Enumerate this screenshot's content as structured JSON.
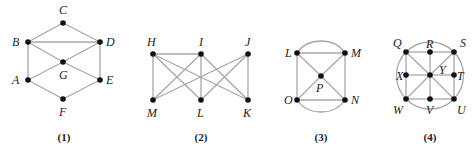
{
  "style": {
    "edge_color": "#a8a8a8",
    "node_color": "#111111",
    "label_color": "#222222",
    "background": "#ffffff"
  },
  "graphs": [
    {
      "caption": "(1)",
      "caption_pos": [
        64,
        141
      ],
      "nodes": [
        {
          "id": "C",
          "x": 63,
          "y": 23,
          "lx": 59,
          "ly": 14
        },
        {
          "id": "B",
          "x": 28,
          "y": 42,
          "lx": 12,
          "ly": 46
        },
        {
          "id": "D",
          "x": 100,
          "y": 42,
          "lx": 106,
          "ly": 46
        },
        {
          "id": "G",
          "x": 63,
          "y": 62,
          "lx": 59,
          "ly": 79
        },
        {
          "id": "A",
          "x": 28,
          "y": 80,
          "lx": 12,
          "ly": 84
        },
        {
          "id": "E",
          "x": 100,
          "y": 80,
          "lx": 106,
          "ly": 84
        },
        {
          "id": "F",
          "x": 63,
          "y": 99,
          "lx": 59,
          "ly": 116
        }
      ],
      "edges": [
        [
          "B",
          "C"
        ],
        [
          "C",
          "D"
        ],
        [
          "B",
          "D"
        ],
        [
          "B",
          "A"
        ],
        [
          "D",
          "E"
        ],
        [
          "B",
          "G"
        ],
        [
          "G",
          "E"
        ],
        [
          "D",
          "G"
        ],
        [
          "G",
          "A"
        ],
        [
          "A",
          "F"
        ],
        [
          "F",
          "E"
        ]
      ],
      "arcs": []
    },
    {
      "caption": "(2)",
      "caption_pos": [
        201,
        141
      ],
      "nodes": [
        {
          "id": "H",
          "x": 153,
          "y": 54,
          "lx": 147,
          "ly": 46
        },
        {
          "id": "I",
          "x": 201,
          "y": 54,
          "lx": 199,
          "ly": 46
        },
        {
          "id": "J",
          "x": 248,
          "y": 54,
          "lx": 245,
          "ly": 46
        },
        {
          "id": "M",
          "x": 153,
          "y": 100,
          "lx": 147,
          "ly": 117
        },
        {
          "id": "L",
          "x": 201,
          "y": 100,
          "lx": 197,
          "ly": 117
        },
        {
          "id": "K",
          "x": 248,
          "y": 100,
          "lx": 243,
          "ly": 117
        }
      ],
      "edges": [
        [
          "H",
          "I"
        ],
        [
          "H",
          "M"
        ],
        [
          "H",
          "L"
        ],
        [
          "H",
          "K"
        ],
        [
          "I",
          "M"
        ],
        [
          "I",
          "L"
        ],
        [
          "I",
          "K"
        ],
        [
          "J",
          "M"
        ],
        [
          "J",
          "L"
        ],
        [
          "J",
          "K"
        ]
      ],
      "arcs": []
    },
    {
      "caption": "(3)",
      "caption_pos": [
        321,
        141
      ],
      "nodes": [
        {
          "id": "L",
          "x": 297,
          "y": 53,
          "lx": 285,
          "ly": 57
        },
        {
          "id": "M",
          "x": 345,
          "y": 53,
          "lx": 351,
          "ly": 57
        },
        {
          "id": "P",
          "x": 321,
          "y": 76,
          "lx": 316,
          "ly": 92
        },
        {
          "id": "O",
          "x": 297,
          "y": 100,
          "lx": 284,
          "ly": 104
        },
        {
          "id": "N",
          "x": 345,
          "y": 100,
          "lx": 351,
          "ly": 104
        }
      ],
      "edges": [
        [
          "L",
          "M"
        ],
        [
          "L",
          "O"
        ],
        [
          "M",
          "N"
        ],
        [
          "O",
          "N"
        ],
        [
          "L",
          "P"
        ],
        [
          "P",
          "N"
        ],
        [
          "M",
          "P"
        ],
        [
          "P",
          "O"
        ]
      ],
      "arcs": [
        {
          "d": "M 297 53 C 308 37, 334 37, 345 53"
        },
        {
          "d": "M 297 100 C 308 116, 334 116, 345 100"
        }
      ]
    },
    {
      "caption": "(4)",
      "caption_pos": [
        430,
        141
      ],
      "nodes": [
        {
          "id": "Q",
          "x": 406,
          "y": 52,
          "lx": 393,
          "ly": 47
        },
        {
          "id": "R",
          "x": 430,
          "y": 52,
          "lx": 426,
          "ly": 48
        },
        {
          "id": "S",
          "x": 454,
          "y": 52,
          "lx": 460,
          "ly": 47
        },
        {
          "id": "X",
          "x": 406,
          "y": 75,
          "lx": 396,
          "ly": 80
        },
        {
          "id": "Y",
          "x": 430,
          "y": 75,
          "lx": 439,
          "ly": 74
        },
        {
          "id": "T",
          "x": 454,
          "y": 75,
          "lx": 457,
          "ly": 80
        },
        {
          "id": "W",
          "x": 406,
          "y": 99,
          "lx": 393,
          "ly": 114
        },
        {
          "id": "V",
          "x": 430,
          "y": 99,
          "lx": 426,
          "ly": 114
        },
        {
          "id": "U",
          "x": 454,
          "y": 99,
          "lx": 457,
          "ly": 114
        }
      ],
      "edges": [
        [
          "Q",
          "R"
        ],
        [
          "R",
          "S"
        ],
        [
          "W",
          "V"
        ],
        [
          "V",
          "U"
        ],
        [
          "Q",
          "X"
        ],
        [
          "X",
          "W"
        ],
        [
          "S",
          "T"
        ],
        [
          "T",
          "U"
        ],
        [
          "R",
          "Y"
        ],
        [
          "Y",
          "V"
        ],
        [
          "X",
          "Y"
        ],
        [
          "Y",
          "T"
        ],
        [
          "Q",
          "Y"
        ],
        [
          "Y",
          "U"
        ],
        [
          "S",
          "Y"
        ],
        [
          "Y",
          "W"
        ]
      ],
      "arcs": [
        {
          "circle": [
            430,
            75.5,
            33.5
          ]
        }
      ]
    }
  ]
}
